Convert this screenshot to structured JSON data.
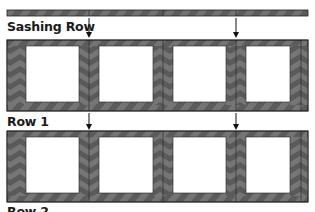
{
  "diagram": {
    "labels": {
      "sashing_row": "Sashing Row",
      "row1": "Row 1",
      "row2": "Row 2"
    },
    "colors": {
      "dark": "#4a4a4a",
      "medium": "#6e6e6e",
      "line": "#222222",
      "white": "#ffffff"
    },
    "blocks_per_row": 4,
    "arrow_positions_x": [
      89,
      236
    ]
  }
}
